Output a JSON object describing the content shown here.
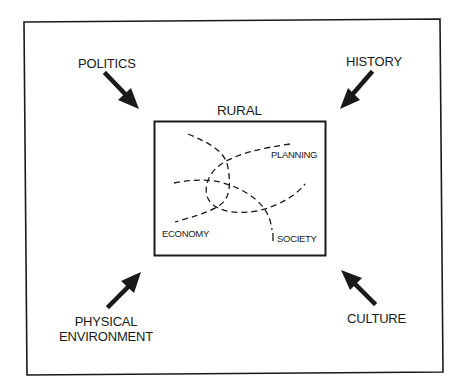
{
  "diagram": {
    "title": "RURAL",
    "factors": {
      "top_left": "POLITICS",
      "top_right": "HISTORY",
      "bottom_left_line1": "PHYSICAL",
      "bottom_left_line2": "ENVIRONMENT",
      "bottom_right": "CULTURE"
    },
    "domains": {
      "planning": "PLANNING",
      "economy": "ECONOMY",
      "society": "SOCIETY"
    },
    "arrows": [
      {
        "from": "POLITICS",
        "direction": "down-right",
        "points_to": "RURAL"
      },
      {
        "from": "HISTORY",
        "direction": "down-left",
        "points_to": "RURAL"
      },
      {
        "from": "PHYSICAL ENVIRONMENT",
        "direction": "up-right",
        "points_to": "RURAL"
      },
      {
        "from": "CULTURE",
        "direction": "up-left",
        "points_to": "RURAL"
      }
    ],
    "colors": {
      "ink": "#1a1a1a",
      "background": "#ffffff"
    }
  }
}
